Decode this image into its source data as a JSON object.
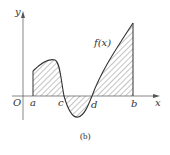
{
  "figure": {
    "caption": "(b)",
    "axes": {
      "x_label": "x",
      "y_label": "y",
      "origin_label": "O"
    },
    "function_label": "f(x)",
    "points": {
      "a": "a",
      "c": "c",
      "d": "d",
      "b": "b"
    },
    "colors": {
      "line": "#333333",
      "hatch": "#555555",
      "background": "#ffffff"
    }
  }
}
